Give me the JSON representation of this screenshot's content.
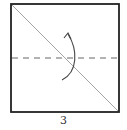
{
  "diagram": {
    "type": "origami-fold-step",
    "step_number": "3",
    "elements": {
      "paper_square": {
        "stroke": "#222222"
      },
      "diagonal_crease": {
        "stroke": "#999999",
        "direction": "top-left to bottom-right"
      },
      "valley_fold_line": {
        "stroke": "#666666",
        "style": "dashed",
        "orientation": "horizontal",
        "position": "middle"
      },
      "fold_arrow": {
        "stroke": "#444444",
        "direction": "up"
      }
    }
  }
}
